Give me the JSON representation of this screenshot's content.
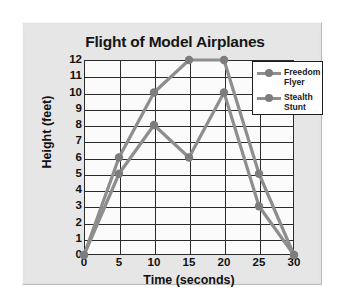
{
  "figure": {
    "title": "Flight of Model Airplanes",
    "background_color": "#e6e6e6",
    "plot_background_color": "#fbfbfb",
    "frame_color": "#2b2b2b"
  },
  "legend": {
    "position": "top-right-inside",
    "entries": [
      {
        "name": "Freedom Flyer",
        "line1": "Freedom",
        "line2": "Flyer",
        "color": "#8e8e8e",
        "marker": "circle",
        "marker_color": "#7d7d7d"
      },
      {
        "name": "Stealth Stunt",
        "line1": "Stealth",
        "line2": "Stunt",
        "color": "#8e8e8e",
        "marker": "circle",
        "marker_color": "#7d7d7d"
      }
    ]
  },
  "chart_data": {
    "type": "line",
    "title": "Flight of Model Airplanes",
    "xlabel": "Time (seconds)",
    "ylabel": "Height (feet)",
    "x": [
      0,
      5,
      10,
      15,
      20,
      25,
      30
    ],
    "xlim": [
      0,
      30
    ],
    "ylim": [
      0,
      12
    ],
    "xticks": [
      0,
      5,
      10,
      15,
      20,
      25,
      30
    ],
    "yticks": [
      0,
      1,
      2,
      3,
      4,
      5,
      6,
      7,
      8,
      9,
      10,
      11,
      12
    ],
    "grid": true,
    "grid_axes": "both",
    "legend_position": "upper right",
    "series": [
      {
        "name": "Freedom Flyer",
        "color": "#8e8e8e",
        "marker": "circle",
        "values": [
          0,
          6,
          10,
          12,
          12,
          5,
          0
        ]
      },
      {
        "name": "Stealth Stunt",
        "color": "#8e8e8e",
        "marker": "circle",
        "values": [
          0,
          5,
          8,
          6,
          10,
          3,
          0
        ]
      }
    ]
  }
}
